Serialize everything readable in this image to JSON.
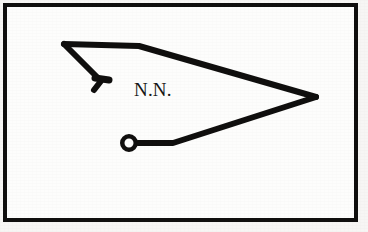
{
  "image": {
    "width": 368,
    "height": 232,
    "background_color": "#f7f6f4",
    "paper_color": "#fdfdfc",
    "ink_color": "#100f0e"
  },
  "frame": {
    "name": "border-frame",
    "x": 3,
    "y": 3,
    "width": 355,
    "height": 219,
    "stroke_width": 4,
    "color": "#100f0e"
  },
  "label": {
    "text": "N.N.",
    "x": 134,
    "y": 80,
    "font_size": 19,
    "color": "#171615"
  },
  "figure": {
    "stroke_color": "#100f0e",
    "stroke_width": 6,
    "shapes": [
      {
        "name": "top-edge",
        "type": "polyline",
        "points": "64,44 139,46 316,97"
      },
      {
        "name": "lower-edge",
        "type": "polyline",
        "points": "316,97 173,143 138,143"
      },
      {
        "name": "staff-diagonal",
        "type": "polyline",
        "points": "64,44 101,81 94,90"
      },
      {
        "name": "staff-barb",
        "type": "polyline",
        "points": "95,78 109,80"
      },
      {
        "name": "ring",
        "type": "circle",
        "cx": 129,
        "cy": 143,
        "outer_radius": 9,
        "inner_radius": 4.5
      }
    ]
  }
}
